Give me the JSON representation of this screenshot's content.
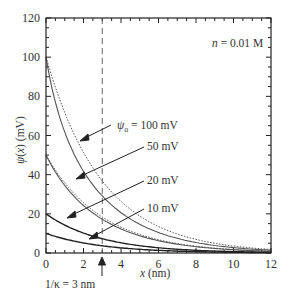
{
  "chart_data": {
    "type": "line",
    "title": "",
    "xlabel": "x (nm)",
    "ylabel": "ψ(x) (mV)",
    "xlim": [
      0,
      12
    ],
    "ylim": [
      0,
      120
    ],
    "x_ticks": [
      0,
      2,
      4,
      6,
      8,
      10,
      12
    ],
    "y_ticks": [
      0,
      20,
      40,
      60,
      80,
      100,
      120
    ],
    "grid": false,
    "debye_length_nm": 3,
    "kT_over_e_mV": 25.7,
    "series": [
      {
        "name": "ψo = 100 mV (nonlinear, solid)",
        "psi0": 100,
        "style": "solid",
        "x": [
          0,
          1,
          2,
          3,
          4,
          5,
          6,
          8,
          10,
          12
        ],
        "values": [
          100,
          64.5,
          44.2,
          29.1,
          19.8,
          13.6,
          9.4,
          4.5,
          2.1,
          1.0
        ]
      },
      {
        "name": "ψo = 100 mV (linear, dotted)",
        "psi0": 100,
        "style": "dotted",
        "x": [
          0,
          1,
          2,
          3,
          4,
          5,
          6,
          8,
          10,
          12
        ],
        "values": [
          100,
          71.7,
          51.3,
          36.8,
          26.4,
          18.9,
          13.5,
          6.9,
          3.6,
          1.8
        ]
      },
      {
        "name": "ψo = 50 mV (nonlinear, solid)",
        "psi0": 50,
        "style": "solid",
        "x": [
          0,
          1,
          2,
          3,
          4,
          5,
          6,
          8,
          10,
          12
        ],
        "values": [
          50,
          35.0,
          24.4,
          16.9,
          11.8,
          8.2,
          5.7,
          2.7,
          1.3,
          0.6
        ]
      },
      {
        "name": "ψo = 50 mV (linear, dotted)",
        "psi0": 50,
        "style": "dotted",
        "x": [
          0,
          1,
          2,
          3,
          4,
          5,
          6,
          8,
          10,
          12
        ],
        "values": [
          50,
          35.8,
          25.7,
          18.4,
          13.2,
          9.4,
          6.8,
          3.5,
          1.8,
          0.9
        ]
      },
      {
        "name": "ψo = 20 mV",
        "psi0": 20,
        "style": "solid",
        "x": [
          0,
          1,
          2,
          3,
          4,
          5,
          6,
          8,
          10,
          12
        ],
        "values": [
          20,
          14.3,
          10.2,
          7.3,
          5.2,
          3.7,
          2.7,
          1.4,
          0.7,
          0.4
        ]
      },
      {
        "name": "ψo = 10 mV",
        "psi0": 10,
        "style": "solid",
        "x": [
          0,
          1,
          2,
          3,
          4,
          5,
          6,
          8,
          10,
          12
        ],
        "values": [
          10,
          7.2,
          5.1,
          3.7,
          2.6,
          1.9,
          1.4,
          0.7,
          0.4,
          0.2
        ]
      }
    ],
    "annotations": [
      {
        "text": "n = 0.01 M",
        "x": 11.3,
        "y": 108
      },
      {
        "text": "ψo = 100 mV",
        "x": 4.0,
        "y": 64
      },
      {
        "text": "50 mV",
        "x": 5.4,
        "y": 55
      },
      {
        "text": "20 mV",
        "x": 5.4,
        "y": 37
      },
      {
        "text": "10 mV",
        "x": 5.4,
        "y": 23
      },
      {
        "text": "1/κ = 3 nm",
        "position": "below x-axis at x = 3",
        "marker": "up-arrow"
      }
    ],
    "reference_lines": [
      {
        "type": "vertical",
        "x": 3,
        "style": "dashed"
      }
    ]
  },
  "labels": {
    "n": "n = 0.01 M",
    "psi_prefix": "ψ",
    "psi_sub": "o",
    "psi100_rest": " = 100 mV",
    "psi50": "50 mV",
    "psi20": "20 mV",
    "psi10": "10 mV",
    "debye": "1/κ = 3 nm",
    "xlabel": "x (nm)",
    "ylabel": "ψ(x) (mV)"
  }
}
